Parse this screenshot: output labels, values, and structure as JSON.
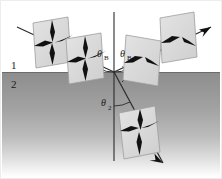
{
  "figure": {
    "border_color": "#e8e8e8",
    "background_color": "#ffffff"
  },
  "media": {
    "upper": {
      "label": "1",
      "label_x": 14,
      "label_y": 67,
      "fill": "#ffffff"
    },
    "lower": {
      "label": "2",
      "label_x": 14,
      "label_y": 85,
      "fill_top": "#8e8e8e",
      "fill_bottom": "#ffffff",
      "interface_y": 72,
      "interface_color": "#6f6f6f"
    }
  },
  "angles": [
    {
      "name": "incidence-angle",
      "label": "θ",
      "subscript": "B",
      "x": 99,
      "y": 58
    },
    {
      "name": "reflection-angle",
      "label": "θ",
      "subscript": "B",
      "x": 121,
      "y": 58
    },
    {
      "name": "refraction-angle",
      "label": "θ",
      "subscript": "2",
      "x": 103,
      "y": 108
    }
  ],
  "rays": {
    "incident": {
      "name": "incident-ray",
      "x1": 17,
      "y1": 27,
      "x2": 114,
      "y2": 72,
      "color": "#2b2b2b",
      "has_arrow_mid": true
    },
    "reflected": {
      "name": "reflected-ray",
      "x1": 114,
      "y1": 72,
      "x2": 211,
      "y2": 27,
      "color": "#2b2b2b",
      "has_arrow_end": true
    },
    "refracted": {
      "name": "refracted-ray",
      "x1": 114,
      "y1": 72,
      "x2": 162,
      "y2": 162,
      "color": "#2b2b2b",
      "has_arrow_end": true
    },
    "normal": {
      "name": "surface-normal",
      "x1": 114,
      "y1": 12,
      "x2": 114,
      "y2": 160,
      "color": "#2b2b2b"
    }
  },
  "right_angle_marker": {
    "name": "right-angle-marker",
    "x": 117,
    "y": 74,
    "size": 11
  },
  "polarization_planes": [
    {
      "name": "incident-plane-far",
      "cx": 52,
      "cy": 42,
      "both_polarizations": true
    },
    {
      "name": "incident-plane-near",
      "cx": 85,
      "cy": 58,
      "both_polarizations": true
    },
    {
      "name": "reflected-plane-near",
      "cx": 145,
      "cy": 56,
      "both_polarizations": false
    },
    {
      "name": "reflected-plane-far",
      "cx": 178,
      "cy": 40,
      "both_polarizations": false
    },
    {
      "name": "refracted-plane",
      "cx": 139,
      "cy": 132,
      "both_polarizations": true
    }
  ],
  "plane_style": {
    "fill": "#dcdcdc",
    "stroke": "#9a9a9a",
    "arrow_color": "#111111"
  }
}
